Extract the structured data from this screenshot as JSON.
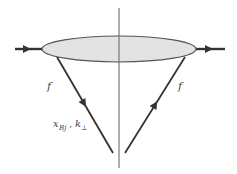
{
  "diagram": {
    "type": "feynman-cut-diagram",
    "colors": {
      "line": "#333333",
      "blob_fill": "#e3e3e3",
      "blob_stroke": "#555555",
      "cut_line": "#777777",
      "text": "#444444"
    },
    "blob": {
      "cx": 119,
      "cy": 49,
      "rx": 77,
      "ry": 13
    },
    "cut_line": {
      "x": 119,
      "y1": 8,
      "y2": 168
    },
    "incoming_line": {
      "x1": 15,
      "y1": 49,
      "x2": 42,
      "y2": 49
    },
    "outgoing_line": {
      "x1": 196,
      "y1": 49,
      "x2": 225,
      "y2": 49
    },
    "left_quark_line": {
      "x1": 57,
      "y1": 57,
      "x2": 113,
      "y2": 153
    },
    "right_quark_line": {
      "x1": 125,
      "y1": 153,
      "x2": 185,
      "y2": 57
    },
    "labels": {
      "left_flavor": "f",
      "right_flavor": "f",
      "kinematics_x": "x",
      "kinematics_x_sub": "Bj",
      "kinematics_sep": ",",
      "kinematics_k": "k",
      "kinematics_k_sub": "⊥"
    }
  }
}
